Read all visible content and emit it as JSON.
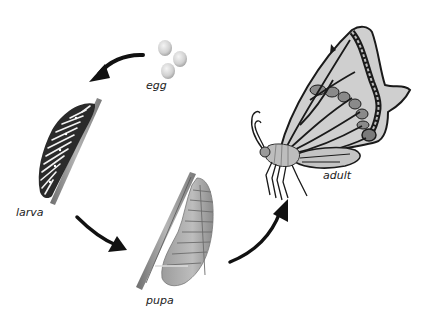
{
  "diagram": {
    "stages": [
      {
        "id": "egg",
        "label": "egg"
      },
      {
        "id": "larva",
        "label": "larva"
      },
      {
        "id": "pupa",
        "label": "pupa"
      },
      {
        "id": "adult",
        "label": "adult"
      }
    ],
    "arrows": [
      {
        "from": "egg",
        "to": "larva"
      },
      {
        "from": "larva",
        "to": "pupa"
      },
      {
        "from": "pupa",
        "to": "adult"
      }
    ],
    "colors": {
      "background": "#ffffff",
      "arrow": "#111111",
      "label": "#222222",
      "egg": "#d8d8d8",
      "stem": "#9a9a9a",
      "wing_light": "#cfcfcf",
      "wing_mid": "#8a8a8a",
      "outline": "#1a1a1a"
    }
  }
}
